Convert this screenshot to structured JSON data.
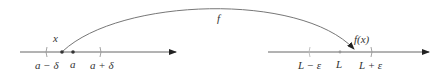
{
  "diagram": {
    "map_label": "f",
    "domain_line": {
      "point_x_label": "x",
      "center_label": "a",
      "left_bound_label": "a − δ",
      "right_bound_label": "a + δ"
    },
    "codomain_line": {
      "image_label": "f(x)",
      "center_label": "L",
      "left_bound_label": "L − ε",
      "right_bound_label": "L + ε"
    },
    "colors": {
      "line": "#555555",
      "point": "#333333",
      "text": "#333333",
      "tick": "#999999"
    }
  }
}
